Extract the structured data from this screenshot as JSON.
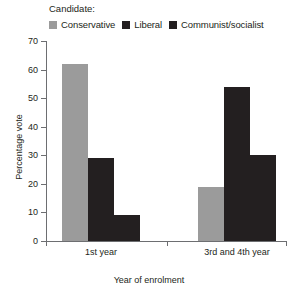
{
  "legend": {
    "title": "Candidate:",
    "entries": [
      {
        "label": "Conservative",
        "color": "#9b9b9b"
      },
      {
        "label": "Liberal",
        "color": "#231f20"
      },
      {
        "label": "Communist/socialist",
        "color": "#231f20"
      }
    ]
  },
  "chart_data": {
    "type": "bar",
    "title": "",
    "xlabel": "Year of enrolment",
    "ylabel": "Percentage vote",
    "categories": [
      "1st year",
      "3rd and 4th year"
    ],
    "series": [
      {
        "name": "Conservative",
        "color": "#9b9b9b",
        "values": [
          62,
          19
        ]
      },
      {
        "name": "Liberal",
        "color": "#231f20",
        "values": [
          29,
          54
        ]
      },
      {
        "name": "Communist/socialist",
        "color": "#231f20",
        "values": [
          9,
          30
        ]
      }
    ],
    "ylim": [
      0,
      70
    ],
    "yticks": [
      0,
      10,
      20,
      30,
      40,
      50,
      60,
      70
    ],
    "ytick_labels": [
      "0",
      "10",
      "20",
      "30",
      "40",
      "50",
      "60",
      "70"
    ],
    "grid": false,
    "legend_position": "top-left"
  }
}
